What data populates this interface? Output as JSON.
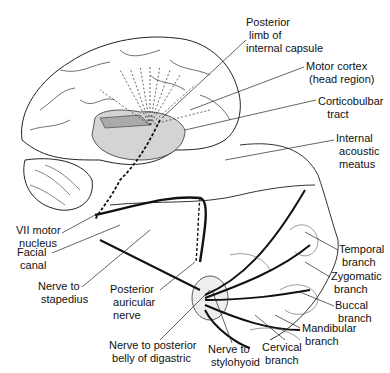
{
  "diagram": {
    "type": "anatomical illustration",
    "labels": [
      {
        "id": "posterior-limb",
        "text": "Posterior\n limb of\ninternal capsule",
        "x": 246,
        "y": 16
      },
      {
        "id": "motor-cortex",
        "text": "Motor cortex\n (head region)",
        "x": 306,
        "y": 60
      },
      {
        "id": "corticobulbar",
        "text": "Corticobulbar\n   tract",
        "x": 318,
        "y": 95
      },
      {
        "id": "internal-acoustic",
        "text": "Internal\n acoustic\n meatus",
        "x": 336,
        "y": 132
      },
      {
        "id": "vii-motor-nucleus",
        "text": "VII motor\n nucleus",
        "x": 16,
        "y": 224
      },
      {
        "id": "facial-canal",
        "text": "Facial\n canal",
        "x": 17,
        "y": 246
      },
      {
        "id": "nerve-to-stapedius",
        "text": "Nerve to\n stapedius",
        "x": 38,
        "y": 280
      },
      {
        "id": "posterior-auricular",
        "text": "Posterior\n auricular\n nerve",
        "x": 110,
        "y": 283
      },
      {
        "id": "nerve-post-belly-digastric",
        "text": "Nerve to posterior\n belly of digastric",
        "x": 109,
        "y": 339
      },
      {
        "id": "nerve-to-stylohyoid",
        "text": "Nerve to\n stylohyoid",
        "x": 208,
        "y": 343
      },
      {
        "id": "temporal-branch",
        "text": "Temporal\n branch",
        "x": 339,
        "y": 243
      },
      {
        "id": "zygomatic-branch",
        "text": "Zygomatic\n branch",
        "x": 331,
        "y": 270
      },
      {
        "id": "buccal-branch",
        "text": "Buccal\n branch",
        "x": 335,
        "y": 299
      },
      {
        "id": "mandibular-branch",
        "text": "Mandibular\n branch",
        "x": 302,
        "y": 322
      },
      {
        "id": "cervical-branch",
        "text": "Cervical\n branch",
        "x": 262,
        "y": 341
      }
    ],
    "colors": {
      "line": "#111111",
      "shade": "#d4d4d4",
      "background": "#ffffff"
    }
  }
}
